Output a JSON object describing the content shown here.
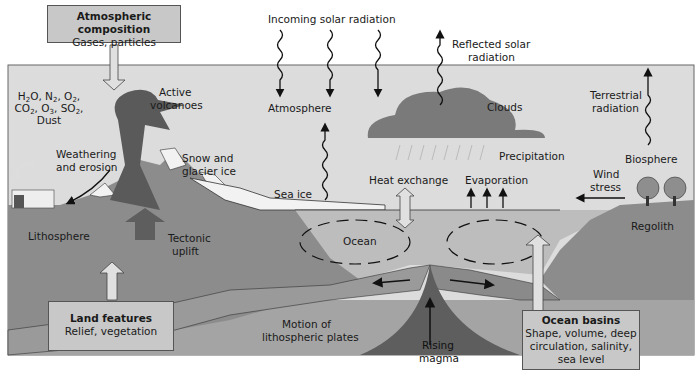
{
  "diagram": {
    "title_box": {
      "title": "Atmospheric composition",
      "subtitle": "Gases, particles"
    },
    "gases": {
      "line1": [
        "H",
        "2",
        "O, N",
        "2",
        ", O",
        "2",
        ","
      ],
      "line2": [
        "CO",
        "2",
        ", O",
        "3",
        ", SO",
        "2",
        ","
      ],
      "line3": "Dust"
    },
    "labels": {
      "incoming_solar": "Incoming solar radiation",
      "reflected_solar_1": "Reflected solar",
      "reflected_solar_2": "radiation",
      "atmosphere": "Atmosphere",
      "active_volcanoes_1": "Active",
      "active_volcanoes_2": "volcanoes",
      "clouds": "Clouds",
      "terrestrial_1": "Terrestrial",
      "terrestrial_2": "radiation",
      "weathering_1": "Weathering",
      "weathering_2": "and erosion",
      "snow_1": "Snow and",
      "snow_2": "glacier ice",
      "precipitation": "Precipitation",
      "biosphere": "Biosphere",
      "sea_ice": "Sea ice",
      "heat_exchange": "Heat exchange",
      "evaporation": "Evaporation",
      "wind_1": "Wind",
      "wind_2": "stress",
      "lithosphere": "Lithosphere",
      "tectonic_1": "Tectonic",
      "tectonic_2": "uplift",
      "ocean": "Ocean",
      "regolith": "Regolith",
      "motion_1": "Motion of",
      "motion_2": "lithospheric plates",
      "rising_1": "Rising",
      "rising_2": "magma"
    },
    "land_box": {
      "title": "Land features",
      "subtitle": "Relief, vegetation"
    },
    "ocean_box": {
      "title": "Ocean basins",
      "line1": "Shape, volume, deep",
      "line2": "circulation, salinity,",
      "line3": "sea level"
    },
    "colors": {
      "sky": "#dcdcdc",
      "land": "#8c8c8c",
      "land_dark": "#6e6e6e",
      "ocean": "#bdbdbd",
      "plate": "#a9a9a9",
      "magma": "#5e5e5e",
      "cloud": "#7a7a7a",
      "box_fill": "#c8c8c8",
      "ice": "#f2f2f2"
    }
  }
}
